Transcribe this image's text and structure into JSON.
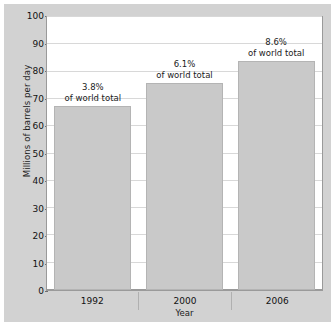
{
  "chart_data": {
    "type": "bar",
    "title": "",
    "subtitle": "",
    "xlabel": "Year",
    "ylabel": "Millions of barrels per day",
    "categories": [
      "1992",
      "2000",
      "2006"
    ],
    "values": [
      67.5,
      76,
      84
    ],
    "ylim": [
      0,
      100
    ],
    "yticks": [
      "0",
      "10",
      "20",
      "30",
      "40",
      "50",
      "60",
      "70",
      "80",
      "90",
      "100"
    ],
    "ytick_values": [
      0,
      10,
      20,
      30,
      40,
      50,
      60,
      70,
      80,
      90,
      100
    ],
    "grid": true,
    "legend": "none",
    "bar_color": "#c9c9c9",
    "plot_background": "#ffffff",
    "figure_background": "#d2d2d2",
    "annotations": [
      {
        "pct": "3.8%",
        "sub": "of world total"
      },
      {
        "pct": "6.1%",
        "sub": "of world total"
      },
      {
        "pct": "8.6%",
        "sub": "of world total"
      }
    ]
  }
}
